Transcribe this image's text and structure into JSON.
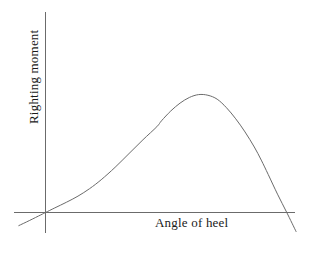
{
  "figure": {
    "background_color": "#ffffff",
    "line_color": "#6b6b6b",
    "text_color": "#1a1a1a"
  },
  "axes": {
    "x_label": "Angle of heel",
    "y_label": "Righting moment",
    "x_axis_name": "horizontal-axis-line",
    "y_axis_name": "vertical-axis-line"
  },
  "chart_data": {
    "type": "line",
    "title": "",
    "xlabel": "Angle of heel",
    "ylabel": "Righting moment",
    "legend": [],
    "grid": false,
    "axis_ticks": {
      "x": [],
      "y": []
    },
    "axis_style": "origin-crossed-axes-without-tick-marks",
    "xlim": [
      -0.15,
      1.15
    ],
    "ylim": [
      -0.22,
      1.1
    ],
    "annotations": [],
    "series": [
      {
        "name": "righting moment curve",
        "x": [
          -0.115,
          -0.07,
          -0.02,
          0.0,
          0.04,
          0.09,
          0.14,
          0.19,
          0.24,
          0.3,
          0.36,
          0.42,
          0.48,
          0.5,
          0.54,
          0.58,
          0.62,
          0.66,
          0.7,
          0.74,
          0.78,
          0.82,
          0.86,
          0.9,
          0.93,
          0.96,
          1.0,
          1.04,
          1.08
        ],
        "y": [
          -0.1,
          -0.062,
          -0.018,
          0.0,
          0.035,
          0.078,
          0.125,
          0.182,
          0.25,
          0.345,
          0.45,
          0.555,
          0.655,
          0.7,
          0.775,
          0.835,
          0.878,
          0.9,
          0.895,
          0.865,
          0.8,
          0.715,
          0.615,
          0.5,
          0.4,
          0.29,
          0.14,
          0.0,
          -0.145
        ]
      }
    ]
  }
}
